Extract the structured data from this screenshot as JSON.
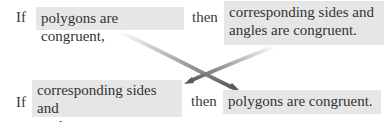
{
  "diagram": {
    "top": {
      "if_label": "If",
      "hypothesis": "polygons are congruent,",
      "then_label": "then",
      "conclusion_line1": "corresponding sides and",
      "conclusion_line2": "angles are congruent."
    },
    "bottom": {
      "if_label": "If",
      "hypothesis_line1": "corresponding sides and",
      "hypothesis_line2": "angles are congruent,",
      "then_label": "then",
      "conclusion": "polygons are congruent."
    },
    "colors": {
      "box_fill": "#e6e6e6",
      "text": "#3a3a3a",
      "arrow": "#6e6e6e"
    }
  }
}
